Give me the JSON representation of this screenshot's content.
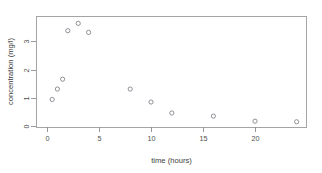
{
  "chart_data": {
    "type": "scatter",
    "title": "",
    "xlabel": "time (hours)",
    "ylabel": "concentration (mg/l)",
    "xlim": [
      -0.6,
      25.2
    ],
    "ylim": [
      -0.1,
      3.85
    ],
    "xticks": [
      0,
      5,
      10,
      15,
      20
    ],
    "yticks": [
      0,
      1,
      2,
      3
    ],
    "xtick_labels": [
      "0",
      "5",
      "10",
      "15",
      "20"
    ],
    "ytick_labels": [
      "0",
      "1",
      "2",
      "3"
    ],
    "grid": false,
    "legend": false,
    "marker": "open-circle",
    "marker_color": "#7d7d86",
    "x": [
      0.5,
      1.0,
      1.5,
      2.0,
      3.0,
      4.0,
      8.0,
      10.0,
      12.0,
      16.0,
      20.0,
      24.0
    ],
    "y": [
      0.94,
      1.31,
      1.66,
      3.38,
      3.64,
      3.32,
      1.31,
      0.85,
      0.46,
      0.35,
      0.17,
      0.15
    ],
    "points": [
      {
        "x": 0.5,
        "y": 0.94
      },
      {
        "x": 1.0,
        "y": 1.31
      },
      {
        "x": 1.5,
        "y": 1.66
      },
      {
        "x": 2.0,
        "y": 3.38
      },
      {
        "x": 3.0,
        "y": 3.64
      },
      {
        "x": 4.0,
        "y": 3.32
      },
      {
        "x": 8.0,
        "y": 1.31
      },
      {
        "x": 10.0,
        "y": 0.85
      },
      {
        "x": 12.0,
        "y": 0.46
      },
      {
        "x": 16.0,
        "y": 0.35
      },
      {
        "x": 20.0,
        "y": 0.17
      },
      {
        "x": 24.0,
        "y": 0.15
      }
    ]
  },
  "axes": {
    "x_title": "time (hours)",
    "y_title": "concentration (mg/l)",
    "x_tick_labels": [
      "0",
      "5",
      "10",
      "15",
      "20"
    ],
    "y_tick_labels": [
      "0",
      "1",
      "2",
      "3"
    ]
  },
  "colors": {
    "background": "#ffffff",
    "frame": "#9a9a9a",
    "marker": "#7d7d86",
    "text": "#3d3d3d"
  }
}
